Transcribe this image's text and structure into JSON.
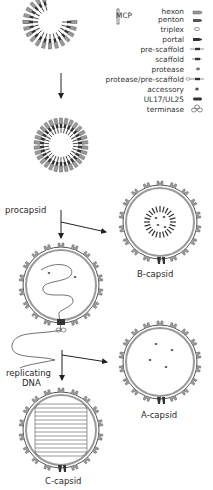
{
  "legend": {
    "group_label": "MCP",
    "items": [
      {
        "label": "hexon",
        "icon": "hexon-icon"
      },
      {
        "label": "penton",
        "icon": "penton-icon"
      },
      {
        "label": "triplex",
        "icon": "triplex-icon"
      },
      {
        "label": "portal",
        "icon": "portal-icon"
      },
      {
        "label": "pre-scaffold",
        "icon": "pre-scaffold-icon"
      },
      {
        "label": "scaffold",
        "icon": "scaffold-icon"
      },
      {
        "label": "protease",
        "icon": "protease-icon"
      },
      {
        "label": "protease/pre-scaffold",
        "icon": "protease-pre-scaffold-icon"
      },
      {
        "label": "accessory",
        "icon": "accessory-icon"
      },
      {
        "label": "UL17/UL25",
        "icon": "ul17-ul25-icon"
      },
      {
        "label": "terminase",
        "icon": "terminase-icon"
      }
    ]
  },
  "stages": {
    "procapsid": "procapsid",
    "b_capsid": "B-capsid",
    "replicating_dna_line1": "replicating",
    "replicating_dna_line2": "DNA",
    "a_capsid": "A-capsid",
    "c_capsid": "C-capsid"
  },
  "colors": {
    "shell_gray": "#9a9a9a",
    "dark": "#333333",
    "line": "#222222"
  }
}
